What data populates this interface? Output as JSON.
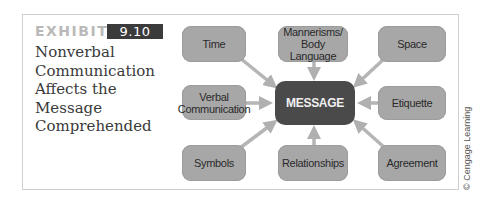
{
  "exhibit": {
    "label": "EXHIBIT",
    "number": "9.10",
    "title_lines": [
      "Nonverbal",
      "Communication",
      "Affects the",
      "Message",
      "Comprehended"
    ]
  },
  "diagram": {
    "center": "MESSAGE",
    "nodes": {
      "time": "Time",
      "mannerisms_line1": "Mannerisms/",
      "mannerisms_line2": "Body Language",
      "space": "Space",
      "verbal_line1": "Verbal",
      "verbal_line2": "Communication",
      "etiquette": "Etiquette",
      "symbols": "Symbols",
      "relationships": "Relationships",
      "agreement": "Agreement"
    },
    "colors": {
      "node_fill": "#a7a7a7",
      "center_fill": "#4a4a4a",
      "arrow": "#b5b5b5",
      "badge": "#3b3b3b"
    }
  },
  "credit": "© Cengage Learning"
}
